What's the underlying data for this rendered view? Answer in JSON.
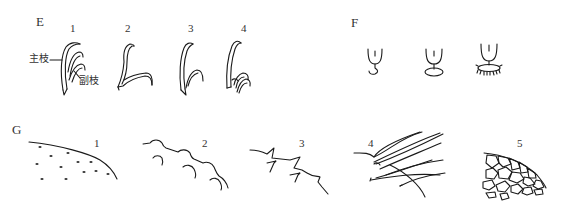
{
  "panels": {
    "E": {
      "label": "E",
      "items": [
        {
          "number": "1",
          "annotations": {
            "main_branch": "主枝",
            "side_branch": "副枝"
          }
        },
        {
          "number": "2"
        },
        {
          "number": "3"
        },
        {
          "number": "4"
        }
      ]
    },
    "F": {
      "label": "F",
      "items": [
        {
          "shape": "cup-with-curled-base"
        },
        {
          "shape": "cup-with-disc-base"
        },
        {
          "shape": "cup-with-fringed-disc-base"
        }
      ]
    },
    "G": {
      "label": "G",
      "items": [
        {
          "number": "1",
          "pattern": "dotted-surface"
        },
        {
          "number": "2",
          "pattern": "scalloped-edge"
        },
        {
          "number": "3",
          "pattern": "zigzag-teeth"
        },
        {
          "number": "4",
          "pattern": "long-hairs"
        },
        {
          "number": "5",
          "pattern": "reticulate-cells"
        }
      ]
    }
  }
}
